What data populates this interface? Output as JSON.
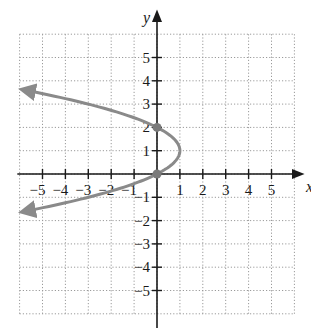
{
  "chart_data": {
    "type": "line",
    "title": "",
    "xlabel": "x",
    "ylabel": "y",
    "xlim": [
      -6,
      6
    ],
    "ylim": [
      -6,
      6
    ],
    "grid": true,
    "grid_style": "dotted",
    "x_ticks": [
      -5,
      -4,
      -3,
      -2,
      -1,
      1,
      2,
      3,
      4,
      5
    ],
    "y_ticks": [
      -5,
      -4,
      -3,
      -2,
      -1,
      1,
      2,
      3,
      4,
      5
    ],
    "x_tick_labels": [
      "−5",
      "−4",
      "−3",
      "−2",
      "−1",
      "1",
      "2",
      "3",
      "4",
      "5"
    ],
    "y_tick_labels": [
      "−5",
      "−4",
      "−3",
      "−2",
      "−1",
      "1",
      "2",
      "3",
      "4",
      "5"
    ],
    "series": [
      {
        "name": "x = -y^2 + 2y",
        "color": "#8a8a8a",
        "points": [
          [
            -5.76,
            3.6
          ],
          [
            -4.25,
            3.25
          ],
          [
            -3,
            3
          ],
          [
            -1.25,
            2.5
          ],
          [
            0,
            2
          ],
          [
            0.75,
            1.5
          ],
          [
            1,
            1
          ],
          [
            0.75,
            0.5
          ],
          [
            0,
            0
          ],
          [
            -1.25,
            -0.5
          ],
          [
            -3,
            -1
          ],
          [
            -4.25,
            -1.25
          ],
          [
            -5.76,
            -1.6
          ]
        ],
        "arrows": [
          "both-ends-left"
        ]
      }
    ],
    "highlighted_points": [
      {
        "x": 0,
        "y": 2
      },
      {
        "x": 0,
        "y": 0
      }
    ]
  },
  "labels": {
    "x_axis": "x",
    "y_axis": "y"
  },
  "colors": {
    "axis": "#1a1a1a",
    "grid": "#9a9a9a",
    "curve": "#8a8a8a",
    "point": "#7a7a7a"
  }
}
